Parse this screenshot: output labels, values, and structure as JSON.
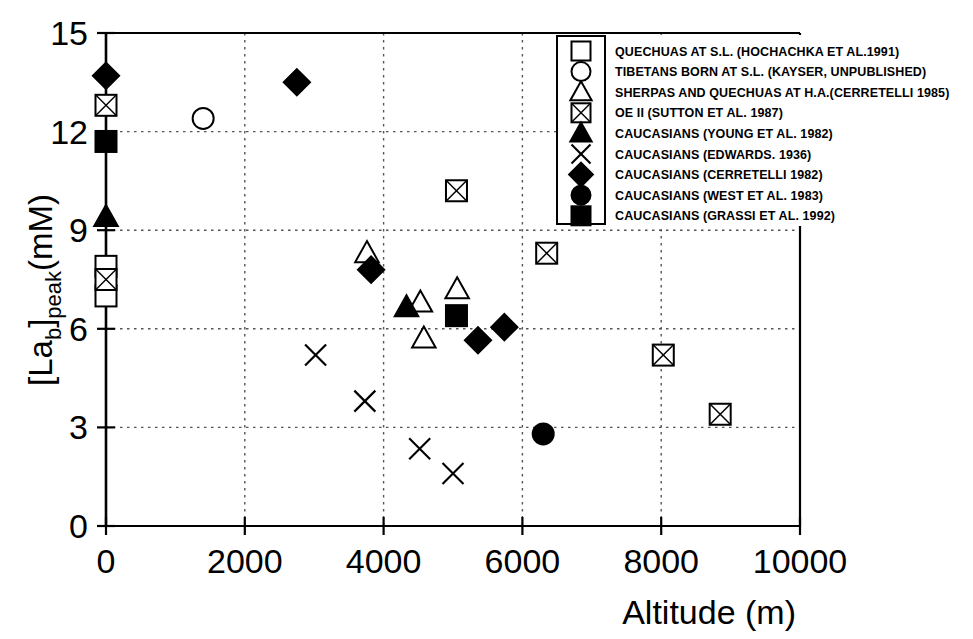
{
  "chart_data": {
    "type": "scatter",
    "title": "",
    "xlabel": "Altitude (m)",
    "ylabel": "[La b] peak (mM)",
    "ylabel_parts": {
      "bracket_open": "[La",
      "sub_b": "b",
      "bracket_close": "]",
      "sub_peak": "peak",
      "units": "(mM)"
    },
    "xlim": [
      0,
      10000
    ],
    "ylim": [
      0,
      15
    ],
    "xticks": [
      0,
      2000,
      4000,
      6000,
      8000,
      10000
    ],
    "yticks": [
      0,
      3,
      6,
      9,
      12,
      15
    ],
    "xtick_labels": [
      "0",
      "2000",
      "4000",
      "6000",
      "8000",
      "10000"
    ],
    "ytick_labels": [
      "0",
      "3",
      "6",
      "9",
      "12",
      "15"
    ],
    "grid": true,
    "grid_style": "dotted",
    "legend_position": "top-right-inside",
    "series": [
      {
        "name": "QUECHUAS AT S.L. (HOCHACHKA ET AL.1991)",
        "marker": "open-square",
        "points": [
          [
            0,
            7.9
          ],
          [
            0,
            7.0
          ]
        ]
      },
      {
        "name": "TIBETANS BORN AT S.L. (KAYSER, UNPUBLISHED)",
        "marker": "open-circle",
        "points": [
          [
            1400,
            12.4
          ]
        ]
      },
      {
        "name": "SHERPAS AND QUECHUAS  AT H.A.(CERRETELLI 1985)",
        "marker": "open-triangle",
        "points": [
          [
            3760,
            8.3
          ],
          [
            4530,
            6.8
          ],
          [
            4580,
            5.7
          ],
          [
            5060,
            7.2
          ]
        ]
      },
      {
        "name": "OE II (SUTTON  ET AL. 1987)",
        "marker": "crossed-square",
        "points": [
          [
            0,
            12.8
          ],
          [
            0,
            7.5
          ],
          [
            5050,
            10.2
          ],
          [
            6350,
            8.3
          ],
          [
            8030,
            5.2
          ],
          [
            8850,
            3.4
          ]
        ]
      },
      {
        "name": "CAUCASIANS (YOUNG ET AL. 1982)",
        "marker": "filled-triangle",
        "points": [
          [
            0,
            9.4
          ],
          [
            4330,
            6.65
          ]
        ]
      },
      {
        "name": "CAUCASIANS (EDWARDS. 1936)",
        "marker": "cross-x",
        "points": [
          [
            3020,
            5.2
          ],
          [
            3730,
            3.8
          ],
          [
            4520,
            2.35
          ],
          [
            5000,
            1.6
          ]
        ]
      },
      {
        "name": "CAUCASIANS (CERRETELLI 1982)",
        "marker": "filled-diamond",
        "points": [
          [
            0,
            13.7
          ],
          [
            2750,
            13.5
          ],
          [
            3820,
            7.8
          ],
          [
            5360,
            5.65
          ],
          [
            5740,
            6.05
          ]
        ]
      },
      {
        "name": "CAUCASIANS (WEST ET AL. 1983)",
        "marker": "filled-circle",
        "points": [
          [
            6300,
            2.8
          ]
        ]
      },
      {
        "name": "CAUCASIANS (GRASSI ET AL. 1992)",
        "marker": "filled-square",
        "points": [
          [
            0,
            11.7
          ],
          [
            5050,
            6.4
          ]
        ]
      }
    ]
  },
  "legend": {
    "entries": [
      {
        "marker": "open-square",
        "label": "QUECHUAS AT S.L. (HOCHACHKA ET AL.1991)"
      },
      {
        "marker": "open-circle",
        "label": "TIBETANS BORN AT S.L. (KAYSER, UNPUBLISHED)"
      },
      {
        "marker": "open-triangle",
        "label": "SHERPAS AND QUECHUAS  AT H.A.(CERRETELLI 1985)"
      },
      {
        "marker": "crossed-square",
        "label": "OE II (SUTTON  ET AL. 1987)"
      },
      {
        "marker": "filled-triangle",
        "label": "CAUCASIANS (YOUNG ET AL. 1982)"
      },
      {
        "marker": "cross-x",
        "label": "CAUCASIANS (EDWARDS. 1936)"
      },
      {
        "marker": "filled-diamond",
        "label": "CAUCASIANS (CERRETELLI 1982)"
      },
      {
        "marker": "filled-circle",
        "label": "CAUCASIANS (WEST ET AL. 1983)"
      },
      {
        "marker": "filled-square",
        "label": "CAUCASIANS (GRASSI ET AL. 1992)"
      }
    ]
  },
  "colors": {
    "marker": "#000000",
    "axis": "#000000",
    "grid": "#555555",
    "background": "#ffffff"
  }
}
